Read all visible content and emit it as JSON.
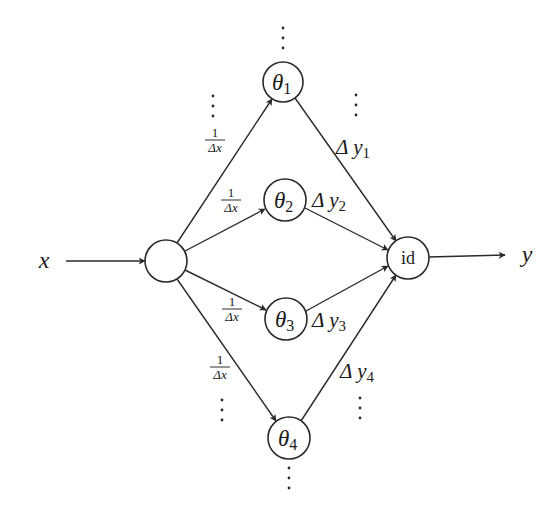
{
  "diagram": {
    "colors": {
      "stroke": "#2a2a2a",
      "text": "#1a1a1a",
      "background": "#ffffff"
    },
    "input": {
      "label": "x",
      "x": 44,
      "y": 268
    },
    "output": {
      "label": "y",
      "x": 527,
      "y": 262
    },
    "nodes": [
      {
        "id": "input",
        "cx": 166,
        "cy": 261,
        "r": 21,
        "label": ""
      },
      {
        "id": "theta1",
        "cx": 283,
        "cy": 82,
        "r": 20,
        "label": "θ",
        "sub": "1"
      },
      {
        "id": "theta2",
        "cx": 285,
        "cy": 200,
        "r": 21,
        "label": "θ",
        "sub": "2"
      },
      {
        "id": "theta3",
        "cx": 286,
        "cy": 319,
        "r": 21,
        "label": "θ",
        "sub": "3"
      },
      {
        "id": "theta4",
        "cx": 289,
        "cy": 438,
        "r": 21,
        "label": "θ",
        "sub": "4"
      },
      {
        "id": "id",
        "cx": 408,
        "cy": 258,
        "r": 21,
        "label": "id"
      }
    ],
    "in_weight_label": {
      "num": "1",
      "den": "Δx"
    },
    "in_weights": [
      {
        "x": 215,
        "y": 128
      },
      {
        "x": 231,
        "y": 188
      },
      {
        "x": 232,
        "y": 297
      },
      {
        "x": 220,
        "y": 355
      }
    ],
    "out_weights": [
      {
        "text": "Δ y",
        "sub": "1",
        "x": 336,
        "y": 154
      },
      {
        "text": "Δ y",
        "sub": "2",
        "x": 312,
        "y": 207
      },
      {
        "text": "Δ y",
        "sub": "3",
        "x": 312,
        "y": 327
      },
      {
        "text": "Δ y",
        "sub": "4",
        "x": 340,
        "y": 378
      }
    ],
    "ellipses": [
      {
        "x": 283,
        "y": 28
      },
      {
        "x": 213,
        "y": 96
      },
      {
        "x": 356,
        "y": 95
      },
      {
        "x": 222,
        "y": 400
      },
      {
        "x": 360,
        "y": 398
      },
      {
        "x": 289,
        "y": 468
      }
    ],
    "edges": [
      {
        "from": "x-label",
        "x1": 66,
        "y1": 261,
        "x2": 145,
        "y2": 261
      },
      {
        "from": "input",
        "to": "theta1",
        "x1": 177,
        "y1": 243,
        "x2": 272,
        "y2": 99
      },
      {
        "from": "input",
        "to": "theta2",
        "x1": 185,
        "y1": 251,
        "x2": 265,
        "y2": 209
      },
      {
        "from": "input",
        "to": "theta3",
        "x1": 185,
        "y1": 270,
        "x2": 266,
        "y2": 310
      },
      {
        "from": "input",
        "to": "theta4",
        "x1": 177,
        "y1": 279,
        "x2": 276,
        "y2": 421
      },
      {
        "from": "theta1",
        "to": "id",
        "x1": 295,
        "y1": 98,
        "x2": 396,
        "y2": 241
      },
      {
        "from": "theta2",
        "to": "id",
        "x1": 305,
        "y1": 208,
        "x2": 388,
        "y2": 250
      },
      {
        "from": "theta3",
        "to": "id",
        "x1": 306,
        "y1": 311,
        "x2": 388,
        "y2": 266
      },
      {
        "from": "theta4",
        "to": "id",
        "x1": 301,
        "y1": 421,
        "x2": 396,
        "y2": 275
      },
      {
        "from": "id",
        "to": "y-label",
        "x1": 429,
        "y1": 257,
        "x2": 505,
        "y2": 255
      }
    ]
  }
}
